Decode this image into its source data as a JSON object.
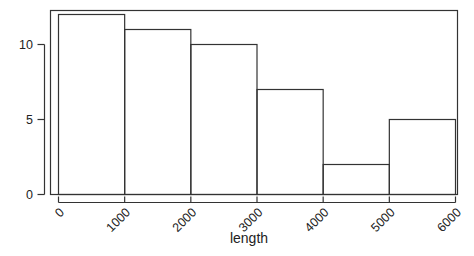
{
  "chart_data": {
    "type": "bar",
    "title": "",
    "subtitle": "",
    "xlabel": "length",
    "ylabel": "",
    "categories": [
      "0-1000",
      "1000-2000",
      "2000-3000",
      "3000-4000",
      "4000-5000",
      "5000-6000"
    ],
    "bin_edges": [
      0,
      1000,
      2000,
      3000,
      4000,
      5000,
      6000
    ],
    "values": [
      12,
      11,
      10,
      7,
      2,
      5
    ],
    "bin_width": 1000,
    "xlim": [
      0,
      6000
    ],
    "ylim": [
      0,
      12.3
    ],
    "xticks": [
      0,
      1000,
      2000,
      3000,
      4000,
      5000,
      6000
    ],
    "xtick_labels": [
      "0",
      "1000",
      "2000",
      "3000",
      "4000",
      "5000",
      "6000"
    ],
    "yticks": [
      0,
      5,
      10
    ],
    "ytick_labels": [
      "0",
      "5",
      "10"
    ],
    "xtick_label_rotation": 45,
    "grid": false,
    "legend": null,
    "bar_fill": "none",
    "bar_stroke": "#333333",
    "frame_stroke": "#333333",
    "background": "#ffffff"
  },
  "figure": {
    "plot_frame_name": "plot-frame",
    "caption": ""
  }
}
